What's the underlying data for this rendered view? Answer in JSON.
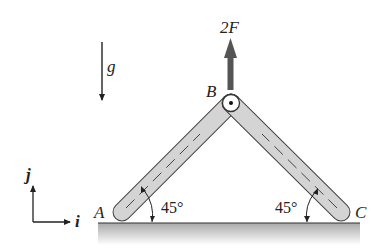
{
  "figure": {
    "labels": {
      "force": "2F",
      "gravity": "g",
      "pin_b": "B",
      "end_a": "A",
      "end_c": "C",
      "axis_i": "i",
      "axis_j": "j"
    },
    "angles": {
      "left": "45°",
      "right": "45°"
    },
    "colors": {
      "bar_fill": "#d4d4d4",
      "bar_stroke": "#444444",
      "force_arrow": "#555555",
      "ground_shade": "#b8b8b8",
      "ink": "#222222"
    }
  }
}
